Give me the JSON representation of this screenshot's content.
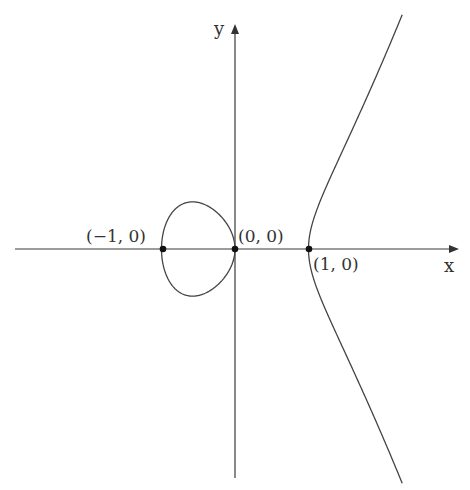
{
  "figure": {
    "axes": {
      "x_label": "x",
      "y_label": "y"
    },
    "points": [
      {
        "name": "point-minus-one",
        "x": -1,
        "y": 0,
        "label": "(−1, 0)"
      },
      {
        "name": "point-origin",
        "x": 0,
        "y": 0,
        "label": "(0, 0)"
      },
      {
        "name": "point-one",
        "x": 1,
        "y": 0,
        "label": "(1, 0)"
      }
    ],
    "colors": {
      "curve": "#444444",
      "axis": "#3a3a3a",
      "point": "#111111",
      "text": "#333333",
      "background": "#ffffff"
    }
  }
}
